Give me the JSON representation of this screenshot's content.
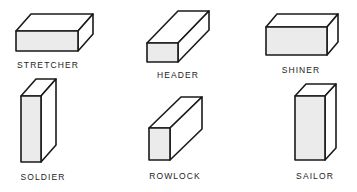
{
  "bricks": [
    {
      "name": "STRETCHER",
      "front": [
        16,
        31,
        62,
        20
      ],
      "depth": [
        15,
        -17
      ],
      "label_x": 48,
      "label_y": 60
    },
    {
      "name": "HEADER",
      "front": [
        147,
        43,
        31,
        19
      ],
      "depth": [
        31,
        -32
      ],
      "label_x": 178,
      "label_y": 70
    },
    {
      "name": "SHINER",
      "front": [
        266,
        27,
        61,
        28
      ],
      "depth": [
        11,
        -13
      ],
      "label_x": 301,
      "label_y": 65
    },
    {
      "name": "SOLDIER",
      "front": [
        21,
        96,
        20,
        66
      ],
      "depth": [
        15,
        -17
      ],
      "label_x": 43,
      "label_y": 172
    },
    {
      "name": "ROWLOCK",
      "front": [
        149,
        128,
        21,
        32
      ],
      "depth": [
        32,
        -31
      ],
      "label_x": 175,
      "label_y": 171
    },
    {
      "name": "SAILOR",
      "front": [
        295,
        96,
        30,
        64
      ],
      "depth": [
        11,
        -12
      ],
      "label_x": 315,
      "label_y": 171
    }
  ],
  "colors": {
    "stroke": "#1a1a1a",
    "front_fill": "#ebebeb",
    "background": "#ffffff"
  }
}
